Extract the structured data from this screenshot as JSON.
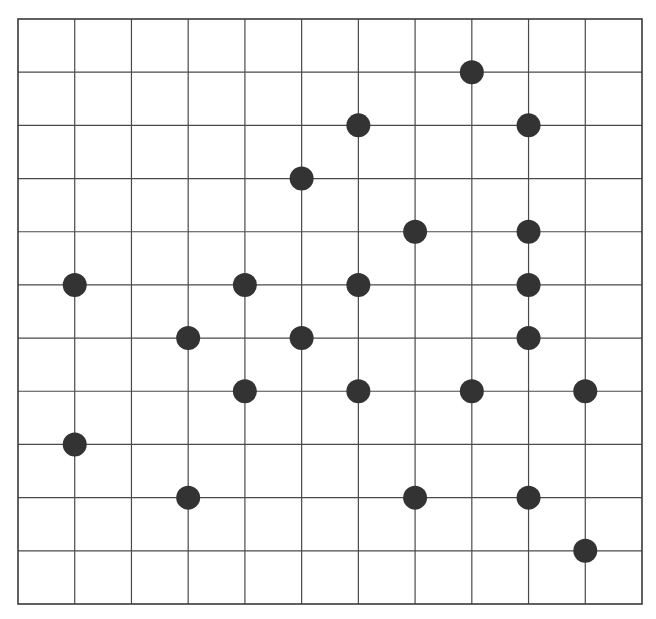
{
  "board": {
    "title": "Grid board with stones",
    "columns": 11,
    "rows": 11,
    "origin_px": [
      18,
      19
    ],
    "end_px": [
      642,
      604
    ],
    "line_color": "#4a4a4a",
    "border_color": "#3a3a3a",
    "background_color": "#ffffff",
    "stone_color": "#333333",
    "stone_radius_px": 12
  },
  "stones": [
    {
      "col": 8,
      "row": 1
    },
    {
      "col": 6,
      "row": 2
    },
    {
      "col": 9,
      "row": 2
    },
    {
      "col": 5,
      "row": 3
    },
    {
      "col": 7,
      "row": 4
    },
    {
      "col": 9,
      "row": 4
    },
    {
      "col": 1,
      "row": 5
    },
    {
      "col": 4,
      "row": 5
    },
    {
      "col": 6,
      "row": 5
    },
    {
      "col": 9,
      "row": 5
    },
    {
      "col": 3,
      "row": 6
    },
    {
      "col": 5,
      "row": 6
    },
    {
      "col": 9,
      "row": 6
    },
    {
      "col": 4,
      "row": 7
    },
    {
      "col": 6,
      "row": 7
    },
    {
      "col": 8,
      "row": 7
    },
    {
      "col": 10,
      "row": 7
    },
    {
      "col": 1,
      "row": 8
    },
    {
      "col": 3,
      "row": 9
    },
    {
      "col": 7,
      "row": 9
    },
    {
      "col": 9,
      "row": 9
    },
    {
      "col": 10,
      "row": 10
    }
  ]
}
